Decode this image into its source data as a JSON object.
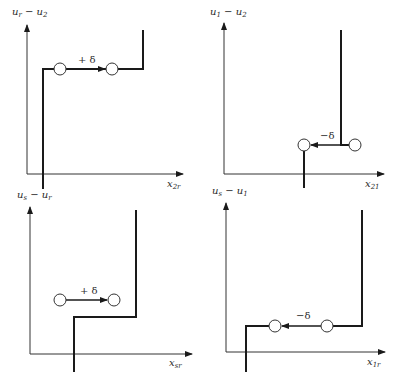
{
  "panels": [
    {
      "id": "top-left",
      "y_label": {
        "main1": "u",
        "sub1": "r",
        "op": " − ",
        "main2": "u",
        "sub2": "2"
      },
      "x_label": {
        "main": "x",
        "sub": "2r"
      },
      "shift_label": "+ δ",
      "direction": "right"
    },
    {
      "id": "top-right",
      "y_label": {
        "main1": "u",
        "sub1": "1",
        "op": " − ",
        "main2": "u",
        "sub2": "2"
      },
      "x_label": {
        "main": "x",
        "sub": "21"
      },
      "shift_label": "−δ",
      "direction": "left"
    },
    {
      "id": "bottom-left",
      "y_label": {
        "main1": "u",
        "sub1": "s",
        "op": " − ",
        "main2": "u",
        "sub2": "r"
      },
      "x_label": {
        "main": "x",
        "sub": "sr"
      },
      "shift_label": "+ δ",
      "direction": "right"
    },
    {
      "id": "bottom-right",
      "y_label": {
        "main1": "u",
        "sub1": "s",
        "op": " − ",
        "main2": "u",
        "sub2": "1"
      },
      "x_label": {
        "main": "x",
        "sub": "1r"
      },
      "shift_label": "−δ",
      "direction": "left"
    }
  ]
}
